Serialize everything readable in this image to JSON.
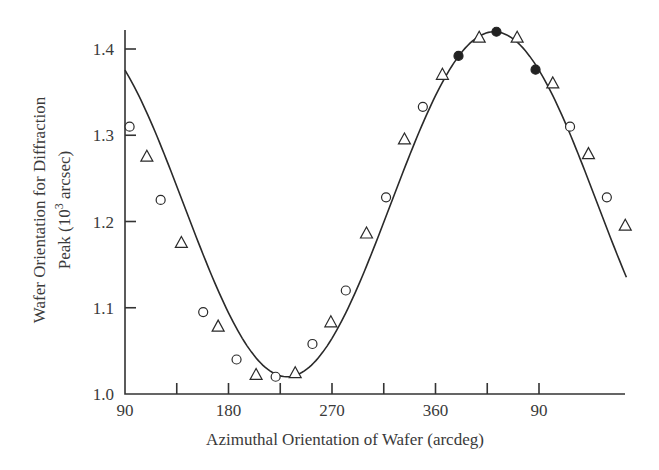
{
  "chart_data": {
    "type": "scatter",
    "title": "",
    "xlabel": "Azimuthal Orientation of Wafer (arcdeg)",
    "ylabel_line1": "Wafer Orientation for Diffraction",
    "ylabel_line2": "Peak (10",
    "ylabel_sup": "3",
    "ylabel_line2_end": " arcsec)",
    "xlim": [
      90,
      527
    ],
    "ylim": [
      1.0,
      1.42
    ],
    "grid": false,
    "legend": null,
    "x_ticks": [
      {
        "value": 90,
        "label": "90"
      },
      {
        "value": 135,
        "label": ""
      },
      {
        "value": 180,
        "label": "180"
      },
      {
        "value": 225,
        "label": ""
      },
      {
        "value": 270,
        "label": "270"
      },
      {
        "value": 315,
        "label": ""
      },
      {
        "value": 360,
        "label": "360"
      },
      {
        "value": 405,
        "label": ""
      },
      {
        "value": 450,
        "label": "90"
      }
    ],
    "y_ticks": [
      {
        "value": 1.0,
        "label": "1.0"
      },
      {
        "value": 1.1,
        "label": "1.1"
      },
      {
        "value": 1.2,
        "label": "1.2"
      },
      {
        "value": 1.3,
        "label": "1.3"
      },
      {
        "value": 1.4,
        "label": "1.4"
      }
    ],
    "series": [
      {
        "name": "open circles",
        "marker": "circle-open",
        "points": [
          {
            "x": 94,
            "y": 1.31
          },
          {
            "x": 121,
            "y": 1.225
          },
          {
            "x": 158,
            "y": 1.095
          },
          {
            "x": 187,
            "y": 1.04
          },
          {
            "x": 221,
            "y": 1.02
          },
          {
            "x": 253,
            "y": 1.058
          },
          {
            "x": 282,
            "y": 1.12
          },
          {
            "x": 317,
            "y": 1.228
          },
          {
            "x": 349,
            "y": 1.333
          },
          {
            "x": 477,
            "y": 1.31
          },
          {
            "x": 509,
            "y": 1.228
          }
        ]
      },
      {
        "name": "open triangles",
        "marker": "triangle-open",
        "points": [
          {
            "x": 109,
            "y": 1.275
          },
          {
            "x": 139,
            "y": 1.175
          },
          {
            "x": 171,
            "y": 1.078
          },
          {
            "x": 204,
            "y": 1.022
          },
          {
            "x": 238,
            "y": 1.024
          },
          {
            "x": 269,
            "y": 1.083
          },
          {
            "x": 300,
            "y": 1.186
          },
          {
            "x": 333,
            "y": 1.295
          },
          {
            "x": 366,
            "y": 1.37
          },
          {
            "x": 398,
            "y": 1.413
          },
          {
            "x": 431,
            "y": 1.413
          },
          {
            "x": 462,
            "y": 1.36
          },
          {
            "x": 493,
            "y": 1.278
          },
          {
            "x": 525,
            "y": 1.195
          }
        ]
      },
      {
        "name": "filled circles",
        "marker": "circle-filled",
        "points": [
          {
            "x": 380,
            "y": 1.392
          },
          {
            "x": 413,
            "y": 1.42
          },
          {
            "x": 447,
            "y": 1.376
          }
        ]
      }
    ],
    "fit_curve": {
      "type": "sinusoid",
      "mean": 1.22,
      "amplitude": 0.2,
      "peak_x": 411,
      "period": 360
    }
  }
}
